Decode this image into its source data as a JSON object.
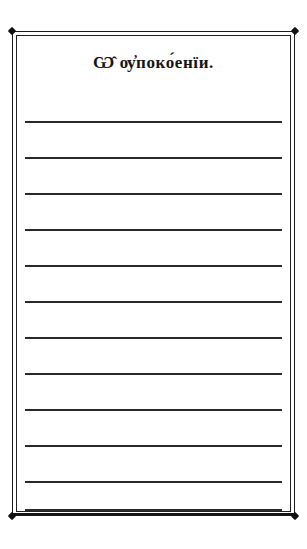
{
  "page": {
    "kind": "ruled-writing-page",
    "language": "Church Slavonic",
    "background_color": "#ffffff",
    "ink_color": "#1b1b1b"
  },
  "frame": {
    "style": "double-rule-with-corner-nodes",
    "corners": [
      {
        "name": "top-left"
      },
      {
        "name": "top-right"
      },
      {
        "name": "bottom-left"
      },
      {
        "name": "bottom-right"
      }
    ]
  },
  "heading": {
    "text": "Ѡ̂ ѹ҆поко́енїи.",
    "transliteration": "O upokoenii.",
    "translation": "On repose."
  },
  "ruled_lines": {
    "count": 12,
    "spacing_px": 36,
    "first_line_y": 121,
    "lines": [
      {
        "index": 1,
        "y": 121
      },
      {
        "index": 2,
        "y": 157
      },
      {
        "index": 3,
        "y": 193
      },
      {
        "index": 4,
        "y": 229
      },
      {
        "index": 5,
        "y": 265
      },
      {
        "index": 6,
        "y": 301
      },
      {
        "index": 7,
        "y": 337
      },
      {
        "index": 8,
        "y": 373
      },
      {
        "index": 9,
        "y": 409
      },
      {
        "index": 10,
        "y": 445
      },
      {
        "index": 11,
        "y": 481
      },
      {
        "index": 12,
        "y": 509
      }
    ]
  }
}
